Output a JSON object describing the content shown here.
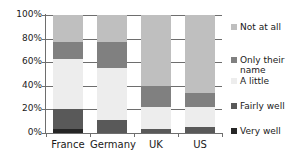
{
  "chart_data": {
    "type": "bar",
    "stacked": true,
    "stack_mode": "percent",
    "title": "",
    "xlabel": "",
    "ylabel": "",
    "categories": [
      "France",
      "Germany",
      "UK",
      "US"
    ],
    "ylim": [
      0,
      100
    ],
    "ytick_labels": [
      "0%",
      "20%",
      "40%",
      "60%",
      "80%",
      "100%"
    ],
    "ytick_values": [
      0,
      20,
      40,
      60,
      80,
      100
    ],
    "grid": true,
    "legend_position": "right",
    "series": [
      {
        "name": "Very well",
        "color": "#262626",
        "values": [
          3,
          0,
          0,
          0
        ]
      },
      {
        "name": "Fairly well",
        "color": "#595959",
        "values": [
          17,
          11,
          3,
          5
        ]
      },
      {
        "name": "A little",
        "color": "#ededed",
        "values": [
          43,
          44,
          19,
          17
        ]
      },
      {
        "name": "Only their name",
        "color": "#808080",
        "values": [
          14,
          22,
          18,
          12
        ]
      },
      {
        "name": "Not at all",
        "color": "#bfbfbf",
        "values": [
          23,
          23,
          60,
          66
        ]
      }
    ],
    "legend_order": [
      "Not at all",
      "Only their name",
      "A little",
      "Fairly well",
      "Very well"
    ]
  },
  "axis": {
    "axis_color": "#6e6e6e"
  }
}
